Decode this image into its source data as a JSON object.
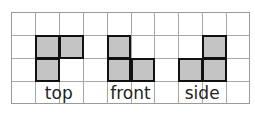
{
  "diagram": {
    "grid": {
      "columns": 10,
      "rows": 4,
      "line_color": "#a8a8a8"
    },
    "shape_fill": "#c4c4c4",
    "shape_border": "#111111",
    "views": [
      {
        "label": "top",
        "cells": [
          [
            1,
            1
          ],
          [
            2,
            1
          ],
          [
            1,
            2
          ]
        ],
        "label_col_start": 1,
        "label_cols": 2
      },
      {
        "label": "front",
        "cells": [
          [
            4,
            1
          ],
          [
            4,
            2
          ],
          [
            5,
            2
          ]
        ],
        "label_col_start": 4,
        "label_cols": 2
      },
      {
        "label": "side",
        "cells": [
          [
            8,
            1
          ],
          [
            7,
            2
          ],
          [
            8,
            2
          ]
        ],
        "label_col_start": 7,
        "label_cols": 2
      }
    ]
  }
}
